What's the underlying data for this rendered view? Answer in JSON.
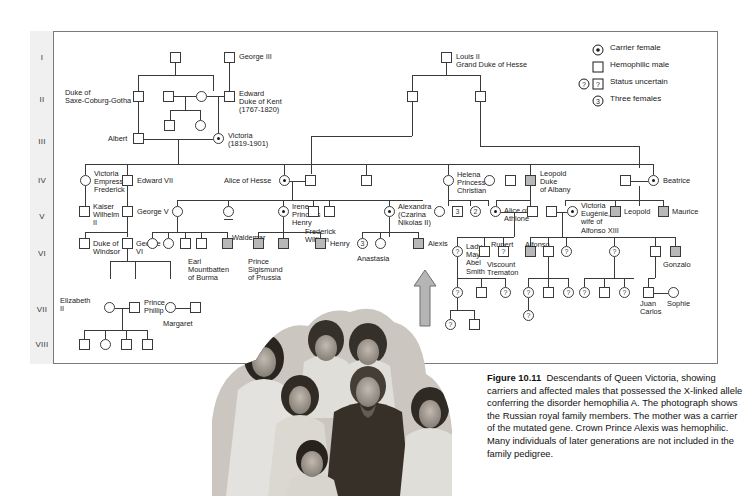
{
  "figure": {
    "number": "Figure 10.11",
    "caption": "Descendants of Queen Victoria, showing carriers and affected males that possessed the X-linked allele conferring the disorder hemophilia A. The photograph shows the Russian royal family members. The mother was a carrier of the mutated gene. Crown Prince Alexis was hemophilic. Many individuals of later generations are not included in the family pedigree."
  },
  "generations": [
    {
      "label": "I"
    },
    {
      "label": "II"
    },
    {
      "label": "III"
    },
    {
      "label": "IV"
    },
    {
      "label": "V"
    },
    {
      "label": "VI"
    },
    {
      "label": "VII"
    },
    {
      "label": "VIII"
    }
  ],
  "legend": {
    "title": "",
    "items": [
      {
        "symbol": "carrier-female-circle",
        "label": "Carrier female"
      },
      {
        "symbol": "hemophilic-male-square",
        "label": "Hemophilic male"
      },
      {
        "symbol": "status-uncertain-circle-square",
        "label": "Status uncertain",
        "mark": "?"
      },
      {
        "symbol": "three-females-circle",
        "label": "Three females",
        "mark": "3"
      }
    ]
  },
  "names": {
    "george_iii": "George III",
    "duke_saxe_coburg_gotha": "Duke of\nSaxe-Coburg-Gotha",
    "edward_duke_of_kent": "Edward\nDuke of Kent\n(1767-1820)",
    "albert": "Albert",
    "victoria": "Victoria\n(1819-1901)",
    "louis_ii": "Louis II\nGrand Duke of Hesse",
    "victoria_empress_frederick": "Victoria\nEmpress\nFrederick",
    "edward_vii": "Edward VII",
    "alice_of_hesse": "Alice of Hesse",
    "helena_princess_christian": "Helena\nPrincess\nChristian",
    "leopold_duke_of_albany": "Leopold\nDuke\nof Albany",
    "beatrice": "Beatrice",
    "kaiser_wilhelm_ii": "Kaiser\nWilhelm\nII",
    "george_v": "George V",
    "irene_princess_henry": "Irene\nPrincess\nHenry",
    "frederick_william": "Frederick\nWilliam",
    "alexandra": "Alexandra\n(Czarina\nNikolas II)",
    "alice_of_athlone": "Alice of\nAthlone",
    "victoria_eugenie": "Victoria\nEugénie,\nwife of\nAlfonso XIII",
    "leopold": "Leopold",
    "maurice": "Maurice",
    "duke_of_windsor": "Duke of\nWindsor",
    "george_vi": "George\nVI",
    "waldemar": "Waldemar",
    "earl_mountbatten": "Earl\nMountbatten\nof Burma",
    "prince_sigismund": "Prince\nSigismund\nof Prussia",
    "henry": "Henry",
    "anastasia": "Anastasia",
    "alexis": "Alexis",
    "lady_may_abel_smith": "Lady\nMay\nAbel\nSmith",
    "rupert_viscount_trematon": "Rupert",
    "viscount_trematon": "Viscount\nTrematon",
    "alfonso": "Alfonso",
    "gonzalo": "Gonzalo",
    "elizabeth_ii": "Elizabeth\nII",
    "prince_phillip": "Prince\nPhillip",
    "margaret": "Margaret",
    "juan_carlos": "Juan\nCarlos",
    "sophie": "Sophie"
  },
  "marks": {
    "three": "3",
    "two": "2",
    "question": "?"
  },
  "colors": {
    "affected_fill": "#b8b8b8",
    "line": "#3a3a3a",
    "frame": "#7a7a7a",
    "genbar": "#f0f0f0",
    "arrow": "#9a9a9a"
  }
}
